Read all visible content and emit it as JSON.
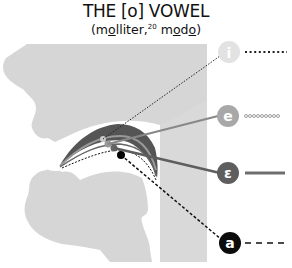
{
  "title": "THE [o] VOWEL",
  "subtitle": {
    "open": "(",
    "word1_parts": [
      "m",
      "o",
      "lliter,"
    ],
    "footnote": "20",
    "word2_parts": [
      " m",
      "o",
      "d",
      "o",
      ")"
    ]
  },
  "vowels": [
    {
      "symbol": "i",
      "circle_color": "#e2e2e2",
      "line_style": "dotted",
      "line_color": "#222222"
    },
    {
      "symbol": "e",
      "circle_color": "#a8a8a8",
      "line_style": "small-circles",
      "line_color": "#888888"
    },
    {
      "symbol": "ɛ",
      "circle_color": "#5e5e5e",
      "line_style": "solid",
      "line_color": "#6e6e6e"
    },
    {
      "symbol": "a",
      "circle_color": "#0c0c0c",
      "line_style": "dashed",
      "line_color": "#111111"
    }
  ],
  "colors": {
    "head_fill": "#d6d6d6",
    "throat_band": "#d9d9d9",
    "palate_dark": "#555555"
  }
}
